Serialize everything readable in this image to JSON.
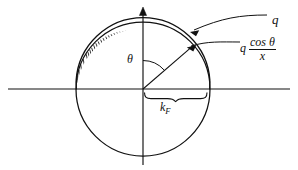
{
  "figure": {
    "stroke_color": "#111111",
    "background": "#ffffff"
  },
  "labels": {
    "q": "q",
    "q_cos_theta": {
      "prefix": "q",
      "numerator": "cos θ",
      "denominator": "x"
    },
    "theta": "θ",
    "k_f": {
      "base": "k",
      "subscript": "F"
    }
  },
  "geometry": {
    "circle": {
      "cx": 143,
      "cy": 89,
      "r": 67
    },
    "outer_arc_offset_y": -9,
    "axis_horizontal": {
      "x1": 8,
      "x2": 290,
      "y": 89
    },
    "axis_vertical": {
      "x": 143,
      "y1": 8,
      "y2": 165
    },
    "angle_theta_degrees": 48,
    "hatch_line_count": 46
  },
  "icons": {
    "axis_arrow": "up-arrow-icon",
    "leader_arrow": "arrowhead-icon",
    "brace": "curly-brace-icon"
  }
}
